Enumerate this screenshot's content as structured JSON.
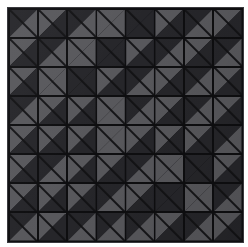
{
  "artwork": {
    "title": "Diagonal Half-Square Triangle Tile Grid",
    "medium": "geometric pattern",
    "grid_columns": 8,
    "grid_rows": 8,
    "tile_shape": "square split by bottom-left to top-right diagonal",
    "background_color": "#ffffff",
    "frame_color": "#3a3a3e",
    "grout_color": "#0e0e10",
    "palette": {
      "dark": "#26262a",
      "light": "#58585c"
    },
    "legend": {
      "dark_label": "dark charcoal triangle",
      "light_label": "medium gray triangle"
    },
    "tiles": [
      [
        {
          "upper": "dark",
          "lower": "light"
        },
        {
          "upper": "light",
          "lower": "dark"
        },
        {
          "upper": "dark",
          "lower": "light"
        },
        {
          "upper": "light",
          "lower": "light"
        },
        {
          "upper": "dark",
          "lower": "dark"
        },
        {
          "upper": "light",
          "lower": "dark"
        },
        {
          "upper": "dark",
          "lower": "light"
        },
        {
          "upper": "light",
          "lower": "dark"
        }
      ],
      [
        {
          "upper": "light",
          "lower": "dark"
        },
        {
          "upper": "dark",
          "lower": "light"
        },
        {
          "upper": "light",
          "lower": "light"
        },
        {
          "upper": "dark",
          "lower": "dark"
        },
        {
          "upper": "light",
          "lower": "dark"
        },
        {
          "upper": "dark",
          "lower": "light"
        },
        {
          "upper": "light",
          "lower": "dark"
        },
        {
          "upper": "dark",
          "lower": "light"
        }
      ],
      [
        {
          "upper": "light",
          "lower": "dark"
        },
        {
          "upper": "light",
          "lower": "light"
        },
        {
          "upper": "dark",
          "lower": "dark"
        },
        {
          "upper": "light",
          "lower": "dark"
        },
        {
          "upper": "dark",
          "lower": "light"
        },
        {
          "upper": "light",
          "lower": "dark"
        },
        {
          "upper": "dark",
          "lower": "light"
        },
        {
          "upper": "light",
          "lower": "dark"
        }
      ],
      [
        {
          "upper": "dark",
          "lower": "light"
        },
        {
          "upper": "light",
          "lower": "dark"
        },
        {
          "upper": "light",
          "lower": "dark"
        },
        {
          "upper": "light",
          "lower": "light"
        },
        {
          "upper": "dark",
          "lower": "light"
        },
        {
          "upper": "light",
          "lower": "dark"
        },
        {
          "upper": "dark",
          "lower": "light"
        },
        {
          "upper": "light",
          "lower": "dark"
        }
      ],
      [
        {
          "upper": "light",
          "lower": "dark"
        },
        {
          "upper": "light",
          "lower": "dark"
        },
        {
          "upper": "light",
          "lower": "dark"
        },
        {
          "upper": "light",
          "lower": "light"
        },
        {
          "upper": "light",
          "lower": "dark"
        },
        {
          "upper": "light",
          "lower": "dark"
        },
        {
          "upper": "light",
          "lower": "dark"
        },
        {
          "upper": "dark",
          "lower": "light"
        }
      ],
      [
        {
          "upper": "light",
          "lower": "dark"
        },
        {
          "upper": "dark",
          "lower": "light"
        },
        {
          "upper": "light",
          "lower": "dark"
        },
        {
          "upper": "light",
          "lower": "dark"
        },
        {
          "upper": "dark",
          "lower": "light"
        },
        {
          "upper": "light",
          "lower": "light"
        },
        {
          "upper": "dark",
          "lower": "dark"
        },
        {
          "upper": "light",
          "lower": "dark"
        }
      ],
      [
        {
          "upper": "light",
          "lower": "dark"
        },
        {
          "upper": "light",
          "lower": "dark"
        },
        {
          "upper": "light",
          "lower": "dark"
        },
        {
          "upper": "dark",
          "lower": "light"
        },
        {
          "upper": "light",
          "lower": "dark"
        },
        {
          "upper": "dark",
          "lower": "dark"
        },
        {
          "upper": "light",
          "lower": "light"
        },
        {
          "upper": "dark",
          "lower": "light"
        }
      ],
      [
        {
          "upper": "dark",
          "lower": "light"
        },
        {
          "upper": "light",
          "lower": "dark"
        },
        {
          "upper": "dark",
          "lower": "light"
        },
        {
          "upper": "dark",
          "lower": "light"
        },
        {
          "upper": "dark",
          "lower": "light"
        },
        {
          "upper": "light",
          "lower": "dark"
        },
        {
          "upper": "dark",
          "lower": "light"
        },
        {
          "upper": "light",
          "lower": "dark"
        }
      ]
    ]
  }
}
